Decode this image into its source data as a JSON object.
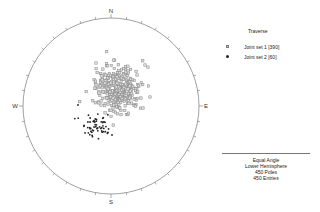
{
  "chart_data": {
    "type": "scatter",
    "title": "Traverse",
    "projection": "Equal Angle",
    "hemisphere": "Lower Hemisphere",
    "net": {
      "center": [
        111,
        106
      ],
      "radius": 88,
      "cardinal_labels": {
        "north": "N",
        "south": "S",
        "east": "E",
        "west": "W"
      },
      "tick_interval_deg": 10
    },
    "series": [
      {
        "name": "Joint set 1",
        "count": 390,
        "symbol": "open-square",
        "color": "#888888",
        "fill": "#dddddd",
        "cluster_center_px": [
          118,
          89
        ],
        "cluster_spread_px": [
          11,
          11
        ],
        "outliers_px": [
          [
            145,
            65
          ],
          [
            96,
            63
          ],
          [
            150,
            97
          ],
          [
            143,
            108
          ]
        ]
      },
      {
        "name": "Joint set 2",
        "count": 60,
        "symbol": "filled-dot",
        "color": "#222222",
        "cluster_center_px": [
          96,
          124
        ],
        "cluster_spread_px": [
          8,
          6
        ],
        "outliers_px": [
          [
            78,
            105
          ],
          [
            112,
            135
          ]
        ]
      }
    ],
    "legend_position": "upper-right",
    "summary": {
      "projection": "Equal Angle",
      "hemisphere": "Lower Hemisphere",
      "poles": "450 Poles",
      "entries": "450 Entries"
    }
  },
  "legend": {
    "title": "Traverse",
    "items": [
      {
        "label": "Joint set 1 [390]",
        "symbol": "open-square"
      },
      {
        "label": "Joint set 2 [60]",
        "symbol": "filled-dot"
      }
    ]
  },
  "info": {
    "line1": "Equal Angle",
    "line2": "Lower Hemisphere",
    "line3": "450 Poles",
    "line4": "450 Entries"
  }
}
